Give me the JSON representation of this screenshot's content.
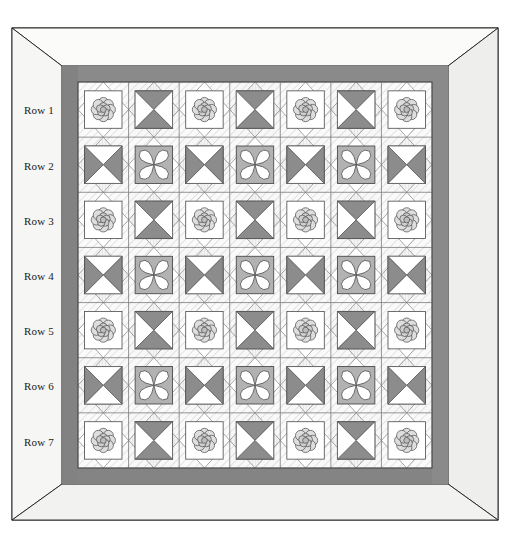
{
  "row_labels": [
    {
      "id": "row-1",
      "text": "Row 1",
      "x": 24,
      "y": 104
    },
    {
      "id": "row-2",
      "text": "Row 2",
      "x": 24,
      "y": 160
    },
    {
      "id": "row-3",
      "text": "Row 3",
      "x": 24,
      "y": 215
    },
    {
      "id": "row-4",
      "text": "Row 4",
      "x": 24,
      "y": 270
    },
    {
      "id": "row-5",
      "text": "Row 5",
      "x": 24,
      "y": 325
    },
    {
      "id": "row-6",
      "text": "Row 6",
      "x": 24,
      "y": 380
    },
    {
      "id": "row-7",
      "text": "Row 7",
      "x": 24,
      "y": 436
    }
  ],
  "colors": {
    "page_background": "#ffffff",
    "outline": "#1d1d1d",
    "frame_face": "#f2f2f0",
    "frame_bevel_light": "#fbfbfa",
    "frame_bevel_shade": "#e8e8e6",
    "border_band": "#8d8d8d",
    "border_band_shade": "#7c7c7c",
    "block_background": "#ffffff",
    "setting_square_light": "#ededed",
    "setting_triangle_light": "#f4f4f4",
    "accent_dark": "#8c8c8c",
    "accent_mid": "#b2b2b2",
    "accent_light": "#d8d8d8",
    "motif_line": "#4a4a4a",
    "grid_line": "#6f6f6f",
    "hatch_line": "#cfcfcf"
  },
  "geometry": {
    "canvas": {
      "width": 510,
      "height": 534
    },
    "frame_outer": {
      "x": 12,
      "y": 28,
      "width": 486,
      "height": 492
    },
    "frame_inner": {
      "x": 62,
      "y": 66,
      "width": 386,
      "height": 418
    },
    "border_band_width": 16,
    "quilt_field": {
      "x": 78,
      "y": 82,
      "width": 354,
      "height": 386
    },
    "columns": 7,
    "rows": 7,
    "cell_width": 50.6,
    "cell_height": 55.1
  },
  "chart_data": {
    "type": "table",
    "xlabel": "Column",
    "ylabel": "Row",
    "columns": [
      "Col 1",
      "Col 2",
      "Col 3",
      "Col 4",
      "Col 5",
      "Col 6",
      "Col 7"
    ],
    "categories": [
      "Row 1",
      "Row 2",
      "Row 3",
      "Row 4",
      "Row 5",
      "Row 6",
      "Row 7"
    ],
    "legend": [
      {
        "key": "flower",
        "label": "Appliqued rose motif block"
      },
      {
        "key": "hourglass-v",
        "label": "Hourglass block, dark top and bottom"
      },
      {
        "key": "hourglass-h",
        "label": "Hourglass block, dark left and right"
      },
      {
        "key": "orange-peel",
        "label": "Four-petal orange peel block"
      }
    ],
    "values": [
      [
        "flower",
        "hourglass-v",
        "flower",
        "hourglass-v",
        "flower",
        "hourglass-v",
        "flower"
      ],
      [
        "hourglass-h",
        "orange-peel",
        "hourglass-h",
        "orange-peel",
        "hourglass-h",
        "orange-peel",
        "hourglass-h"
      ],
      [
        "flower",
        "hourglass-v",
        "flower",
        "hourglass-v",
        "flower",
        "hourglass-v",
        "flower"
      ],
      [
        "hourglass-h",
        "orange-peel",
        "hourglass-h",
        "orange-peel",
        "hourglass-h",
        "orange-peel",
        "hourglass-h"
      ],
      [
        "flower",
        "hourglass-v",
        "flower",
        "hourglass-v",
        "flower",
        "hourglass-v",
        "flower"
      ],
      [
        "hourglass-h",
        "orange-peel",
        "hourglass-h",
        "orange-peel",
        "hourglass-h",
        "orange-peel",
        "hourglass-h"
      ],
      [
        "flower",
        "hourglass-v",
        "flower",
        "hourglass-v",
        "flower",
        "hourglass-v",
        "flower"
      ]
    ]
  }
}
